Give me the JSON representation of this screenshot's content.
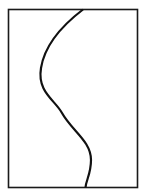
{
  "figure": {
    "canvas": {
      "width": 146,
      "height": 196,
      "background_color": "#ffffff"
    },
    "frame": {
      "name": "rectangular-border",
      "x": 8.5,
      "y": 9.5,
      "width": 129,
      "height": 178,
      "stroke_color": "#1a1a1a",
      "stroke_width": 1.6,
      "fill_color": "#ffffff"
    },
    "curve": {
      "name": "s-curve",
      "stroke_color": "#111111",
      "stroke_width": 2.2,
      "fill": "none",
      "linecap": "butt",
      "path": "M 83 9.5 C 64 24 45 43 41 68 C 37 92 55 100 62 113 C 72 131 91 141 91 160 C 91 174 86 180 85.5 187.5",
      "endpoints": {
        "top": {
          "x": 83,
          "y": 9.5
        },
        "bottom": {
          "x": 85.5,
          "y": 187.5
        }
      },
      "extrema": {
        "leftmost": {
          "x": 40,
          "y": 68
        },
        "inflection": {
          "x": 61,
          "y": 111
        },
        "rightmost": {
          "x": 91,
          "y": 160
        }
      }
    }
  }
}
